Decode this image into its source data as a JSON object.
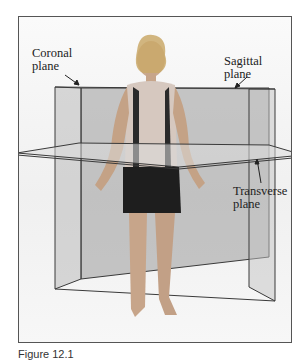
{
  "figure": {
    "labels": {
      "coronal": [
        "Coronal",
        "plane"
      ],
      "sagittal": [
        "Sagittal",
        "plane"
      ],
      "transverse": [
        "Transverse",
        "plane"
      ]
    },
    "caption": "Figure 12.1"
  },
  "colors": {
    "plane_fill": "#8a8a8a",
    "plane_edge": "#3a3a3a",
    "frame_border": "#555555",
    "text": "#222222"
  }
}
